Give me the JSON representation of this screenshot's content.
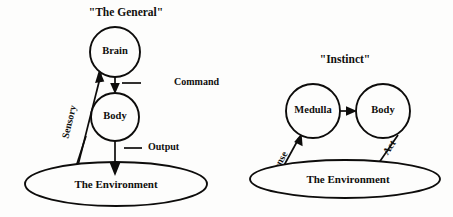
{
  "figure": {
    "background_color": "#fdfdfc",
    "ink_color": "#0d0c0b"
  },
  "panels": [
    {
      "id": "general",
      "title": "\"The General\"",
      "nodes": [
        {
          "id": "brain",
          "label": "Brain",
          "shape": "circle",
          "cx": 115,
          "cy": 52,
          "r": 25
        },
        {
          "id": "body",
          "label": "Body",
          "shape": "circle",
          "cx": 115,
          "cy": 117,
          "r": 24
        },
        {
          "id": "env",
          "label": "The Environment",
          "shape": "ellipse",
          "cx": 116,
          "cy": 184,
          "rx": 91,
          "ry": 22
        }
      ],
      "edges": [
        {
          "id": "command",
          "label": "Command",
          "from": "brain",
          "to": "body",
          "direction": "down"
        },
        {
          "id": "output",
          "label": "Output",
          "from": "body",
          "to": "env",
          "direction": "down"
        },
        {
          "id": "sensory",
          "label": "Sensory",
          "from": "env",
          "to": "brain",
          "direction": "up-right"
        }
      ]
    },
    {
      "id": "instinct",
      "title": "\"Instinct\"",
      "nodes": [
        {
          "id": "medulla",
          "label": "Medulla",
          "shape": "circle",
          "cx": 313,
          "cy": 111,
          "r": 27
        },
        {
          "id": "body2",
          "label": "Body",
          "shape": "circle",
          "cx": 383,
          "cy": 111,
          "r": 27
        },
        {
          "id": "env2",
          "label": "The Environment",
          "shape": "ellipse",
          "cx": 345,
          "cy": 179,
          "rx": 95,
          "ry": 19
        }
      ],
      "edges": [
        {
          "id": "medulla-to-body",
          "label": "",
          "from": "medulla",
          "to": "body2",
          "direction": "right"
        },
        {
          "id": "sense",
          "label": "Sense",
          "from": "env2",
          "to": "medulla",
          "direction": "up-right"
        },
        {
          "id": "act",
          "label": "Act",
          "from": "body2",
          "to": "env2",
          "direction": "down-left"
        }
      ]
    }
  ]
}
